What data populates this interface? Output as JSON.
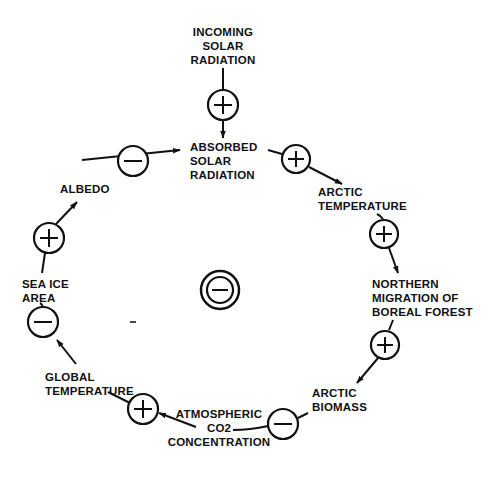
{
  "diagram": {
    "nodes": [
      {
        "id": "incoming",
        "label": "INCOMING\nSOLAR\nRADIATION"
      },
      {
        "id": "absorbed",
        "label": "ABSORBED\nSOLAR\nRADIATION"
      },
      {
        "id": "arctic_temp",
        "label": "ARCTIC\nTEMPERATURE"
      },
      {
        "id": "boreal",
        "label": "NORTHERN\nMIGRATION OF\nBOREAL FOREST"
      },
      {
        "id": "biomass",
        "label": "ARCTIC\nBIOMASS"
      },
      {
        "id": "co2",
        "label": "ATMOSPHERIC\nCO2\nCONCENTRATION"
      },
      {
        "id": "global_temp",
        "label": "GLOBAL\nTEMPERATURE"
      },
      {
        "id": "sea_ice",
        "label": "SEA ICE\nAREA"
      },
      {
        "id": "albedo",
        "label": "ALBEDO"
      }
    ],
    "links": [
      {
        "from": "incoming",
        "to": "absorbed",
        "sign": "+"
      },
      {
        "from": "absorbed",
        "to": "arctic_temp",
        "sign": "+"
      },
      {
        "from": "arctic_temp",
        "to": "boreal",
        "sign": "+"
      },
      {
        "from": "boreal",
        "to": "biomass",
        "sign": "+"
      },
      {
        "from": "biomass",
        "to": "co2",
        "sign": "−"
      },
      {
        "from": "co2",
        "to": "global_temp",
        "sign": "+"
      },
      {
        "from": "global_temp",
        "to": "sea_ice",
        "sign": "−"
      },
      {
        "from": "sea_ice",
        "to": "albedo",
        "sign": "+"
      },
      {
        "from": "albedo",
        "to": "absorbed",
        "sign": "−"
      }
    ],
    "loop_polarity": "−",
    "colors": {
      "ink": "#111111",
      "background": "#ffffff"
    }
  },
  "labels": {
    "incoming": "INCOMING\nSOLAR\nRADIATION",
    "absorbed": "ABSORBED\nSOLAR\nRADIATION",
    "arctic_temp": "ARCTIC\nTEMPERATURE",
    "boreal": "NORTHERN\nMIGRATION OF\nBOREAL FOREST",
    "biomass": "ARCTIC\nBIOMASS",
    "co2": "ATMOSPHERIC\nCO2\nCONCENTRATION",
    "global_temp": "GLOBAL\nTEMPERATURE",
    "sea_ice": "SEA ICE\nAREA",
    "albedo": "ALBEDO"
  }
}
